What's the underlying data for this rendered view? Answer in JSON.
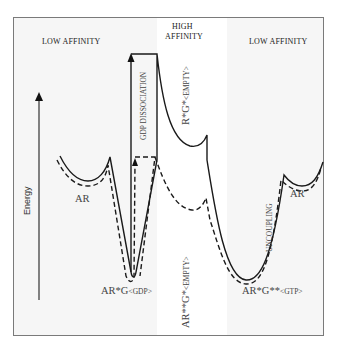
{
  "regions": {
    "left": "LOW AFFINITY",
    "middle_line1": "HIGH",
    "middle_line2": "AFFINITY",
    "right": "LOW AFFINITY"
  },
  "axis": {
    "label": "Energy"
  },
  "states": {
    "ar_left": "AR",
    "ar_right": "AR",
    "arg_gdp_main": "AR*G",
    "arg_gdp_sub": "<GDP>",
    "rg_empty_main": "R*G*",
    "rg_empty_sub": "<EMPTY>",
    "arrg_empty_main": "AR**G*",
    "arrg_empty_sub": "<EMPTY>",
    "argg_gtp_main": "AR*G**",
    "argg_gtp_sub": "<GTP>"
  },
  "transitions": {
    "gdp_dissociation": "GDP DISSOCIATION",
    "uncoupling": "UNCOUPLING"
  },
  "colors": {
    "line": "#1a1a1a",
    "frame": "#7a7a7a",
    "background": "#f6f6f6",
    "band": "#ffffff"
  }
}
